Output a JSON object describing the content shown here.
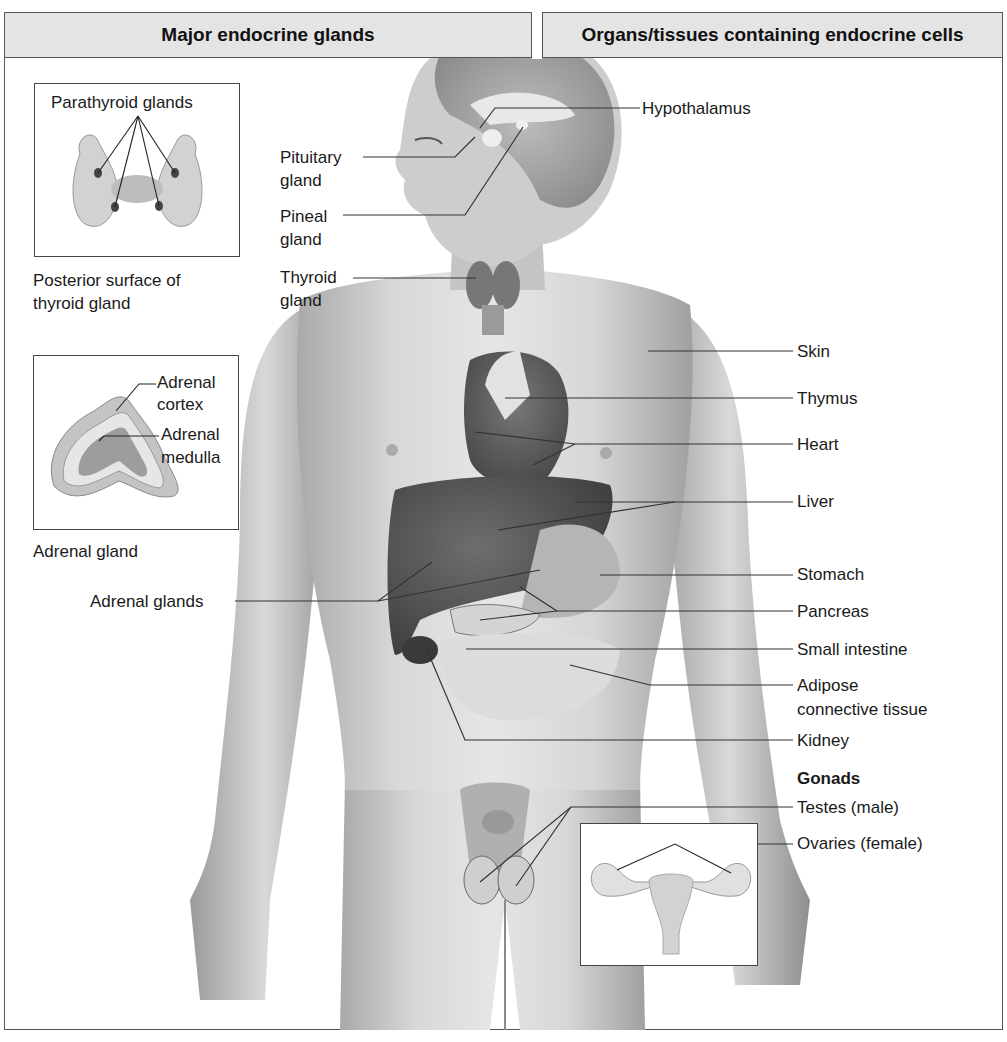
{
  "headers": {
    "left": "Major endocrine glands",
    "right": "Organs/tissues containing endocrine cells"
  },
  "insets": {
    "thyroid": {
      "callout": "Parathyroid glands",
      "caption_line1": "Posterior surface of",
      "caption_line2": "thyroid gland"
    },
    "adrenal": {
      "cortex_line1": "Adrenal",
      "cortex_line2": "cortex",
      "medulla_line1": "Adrenal",
      "medulla_line2": "medulla",
      "caption": "Adrenal gland"
    },
    "ovaries": {
      "depicts": "uterus-and-ovaries"
    }
  },
  "left_labels": {
    "pituitary_line1": "Pituitary",
    "pituitary_line2": "gland",
    "pineal_line1": "Pineal",
    "pineal_line2": "gland",
    "thyroid_line1": "Thyroid",
    "thyroid_line2": "gland",
    "adrenal_glands": "Adrenal glands"
  },
  "right_labels": {
    "hypothalamus": "Hypothalamus",
    "skin": "Skin",
    "thymus": "Thymus",
    "heart": "Heart",
    "liver": "Liver",
    "stomach": "Stomach",
    "pancreas": "Pancreas",
    "small_intestine": "Small intestine",
    "adipose_line1": "Adipose",
    "adipose_line2": "connective tissue",
    "kidney": "Kidney",
    "gonads_heading": "Gonads",
    "testes": "Testes (male)",
    "ovaries": "Ovaries (female)"
  },
  "colors": {
    "header_bg": "#e4e4e4",
    "frame": "#555555",
    "leader_line": "#333333",
    "skin_tone": "#cfcfcf",
    "organ_dark": "#5a5a5a"
  }
}
